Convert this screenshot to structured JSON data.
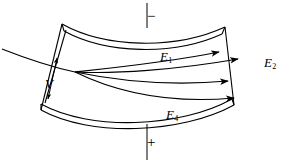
{
  "figure": {
    "background_color": "#ffffff",
    "ink_color": "#000000",
    "width": 287,
    "height": 165
  },
  "labels": {
    "e1": {
      "symbol": "E",
      "subscript": "1"
    },
    "e2": {
      "symbol": "E",
      "subscript": "2"
    },
    "e4": {
      "symbol": "E",
      "subscript": "4"
    },
    "v": {
      "symbol": "V",
      "subscript": ""
    }
  },
  "polarity": {
    "top": "−",
    "bottom": "+"
  },
  "geometry": {
    "top_plate": {
      "outer_path": "M 62,24 C 105,48 175,50 225,27",
      "inner_path": "M 64,31 C 106,54 174,56 222,34",
      "left_cap": "M 62,24 L 64,31",
      "right_cap": "M 225,27 L 222,34"
    },
    "bottom_plate": {
      "outer_path": "M 41,104 C 90,131 180,128 232,99",
      "inner_path": "M 41,110 C 90,137 181,134 234,105",
      "left_cap": "M 41,104 L 41,110",
      "right_cap": "M 232,99 L 234,105"
    },
    "left_edge": "M 62,24 L 41,110",
    "right_edge": "M 225,27 L 234,105",
    "left_edge_inner": "M 64,31 L 44,104",
    "gap_arrow": "M 56,60 L 47,98",
    "entry_beam": "M 2,49 C 30,60 56,68 75,72",
    "focus_point": {
      "x": 75,
      "y": 72
    },
    "terminal_line_top": "M 147,3 L 147,28",
    "terminal_line_bottom": "M 147,124 L 147,160"
  },
  "trajectories": [
    {
      "name": "trajectory-1",
      "path": "M 75,72 C 112,68 170,62 219,52",
      "arrow_x": 219,
      "arrow_y": 52,
      "arrow_angle": -11
    },
    {
      "name": "trajectory-2",
      "path": "M 75,72 C 115,74 175,70 238,59",
      "arrow_x": 238,
      "arrow_y": 59,
      "arrow_angle": -11
    },
    {
      "name": "trajectory-3",
      "path": "M 75,72 C 118,81 172,86 228,81",
      "arrow_x": 228,
      "arrow_y": 81,
      "arrow_angle": -6
    },
    {
      "name": "trajectory-4",
      "path": "M 75,72 C 116,92 168,104 234,98",
      "arrow_x": 234,
      "arrow_y": 98,
      "arrow_angle": -7
    }
  ]
}
